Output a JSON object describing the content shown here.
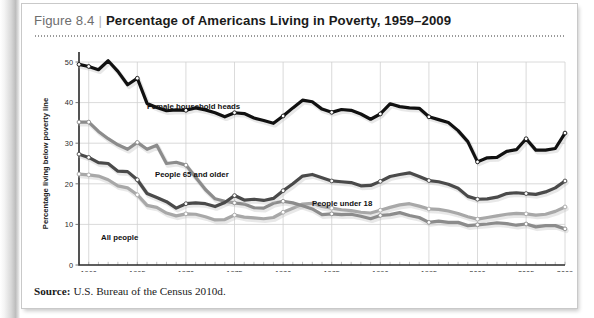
{
  "figure": {
    "number": "Figure 8.4",
    "separator": "|",
    "title": "Percentage of Americans Living in Poverty, 1959–2009",
    "source_label": "Source:",
    "source_text": "U.S. Bureau of the Census 2010d."
  },
  "colors": {
    "female_household_heads": "#111111",
    "people_under_18": "#4a4a4a",
    "people_65_and_older": "#8c8c8c",
    "all_people": "#a8a8a8",
    "axis": "#2a2a2a",
    "grid": "#d0d0d0",
    "panel_border": "#c9c9c9",
    "title_accent": "#6e6e6e"
  },
  "chart_data": {
    "type": "line",
    "title": "Percentage of Americans Living in Poverty, 1959–2009",
    "xlabel": "",
    "ylabel": "Percentage living below poverty line",
    "xlim": [
      1959,
      2009
    ],
    "ylim": [
      0,
      50
    ],
    "yticks": [
      0,
      10,
      20,
      30,
      40,
      50
    ],
    "xticks": [
      1960,
      1965,
      1970,
      1975,
      1980,
      1985,
      1990,
      1995,
      2000,
      2005,
      2009
    ],
    "grid": true,
    "legend": "inline-labels",
    "x": [
      1959,
      1960,
      1961,
      1962,
      1963,
      1964,
      1965,
      1966,
      1967,
      1968,
      1969,
      1970,
      1971,
      1972,
      1973,
      1974,
      1975,
      1976,
      1977,
      1978,
      1979,
      1980,
      1981,
      1982,
      1983,
      1984,
      1985,
      1986,
      1987,
      1988,
      1989,
      1990,
      1991,
      1992,
      1993,
      1994,
      1995,
      1996,
      1997,
      1998,
      1999,
      2000,
      2001,
      2002,
      2003,
      2004,
      2005,
      2006,
      2007,
      2008,
      2009
    ],
    "series": [
      {
        "name": "Female household heads",
        "label": "Female household heads",
        "color": "#111111",
        "values": [
          49.4,
          48.9,
          48.1,
          50.3,
          47.7,
          44.4,
          46.0,
          39.8,
          38.8,
          38.0,
          38.2,
          38.1,
          38.7,
          38.2,
          37.5,
          36.5,
          37.5,
          37.3,
          36.2,
          35.6,
          34.9,
          36.7,
          38.7,
          40.6,
          40.2,
          38.4,
          37.6,
          38.3,
          38.1,
          37.2,
          35.9,
          37.2,
          39.7,
          39.0,
          38.7,
          38.6,
          36.5,
          35.8,
          35.1,
          33.1,
          30.4,
          25.4,
          26.4,
          26.5,
          28.0,
          28.4,
          31.1,
          28.3,
          28.3,
          28.7,
          32.5
        ]
      },
      {
        "name": "People 65 and older",
        "label": "People 65 and older",
        "color": "#8c8c8c",
        "values": [
          35.2,
          35.2,
          32.9,
          31.1,
          29.6,
          28.5,
          30.2,
          28.5,
          29.5,
          25.0,
          25.3,
          24.6,
          21.6,
          18.6,
          16.3,
          15.7,
          15.3,
          15.0,
          14.1,
          14.0,
          15.2,
          15.7,
          15.3,
          14.6,
          13.8,
          12.4,
          12.6,
          12.4,
          12.5,
          12.0,
          11.4,
          12.2,
          12.4,
          12.9,
          12.2,
          11.7,
          10.5,
          10.8,
          10.5,
          10.5,
          9.7,
          9.9,
          10.1,
          10.4,
          10.2,
          9.8,
          10.1,
          9.4,
          9.7,
          9.7,
          8.9
        ]
      },
      {
        "name": "People under 18",
        "label": "People under 18",
        "color": "#4a4a4a",
        "values": [
          27.3,
          26.5,
          25.2,
          25.0,
          23.1,
          23.0,
          21.0,
          17.6,
          16.6,
          15.6,
          14.0,
          15.1,
          15.3,
          15.1,
          14.4,
          15.4,
          17.1,
          16.0,
          16.2,
          15.9,
          16.4,
          18.3,
          20.0,
          21.9,
          22.3,
          21.5,
          20.7,
          20.5,
          20.3,
          19.5,
          19.6,
          20.6,
          21.8,
          22.3,
          22.7,
          21.8,
          20.8,
          20.5,
          19.9,
          18.9,
          16.9,
          16.2,
          16.3,
          16.7,
          17.6,
          17.8,
          17.6,
          17.4,
          18.0,
          19.0,
          20.7
        ]
      },
      {
        "name": "All people",
        "label": "All people",
        "color": "#a8a8a8",
        "values": [
          22.4,
          22.2,
          21.9,
          21.0,
          19.5,
          19.0,
          17.3,
          14.7,
          14.2,
          12.8,
          12.1,
          12.6,
          12.5,
          11.9,
          11.1,
          11.2,
          12.3,
          11.8,
          11.6,
          11.4,
          11.7,
          13.0,
          14.0,
          15.0,
          15.2,
          14.4,
          14.0,
          13.6,
          13.4,
          13.0,
          12.8,
          13.5,
          14.2,
          14.8,
          15.1,
          14.5,
          13.8,
          13.7,
          13.3,
          12.7,
          11.9,
          11.3,
          11.7,
          12.1,
          12.5,
          12.7,
          12.6,
          12.3,
          12.5,
          13.2,
          14.3
        ]
      }
    ]
  }
}
